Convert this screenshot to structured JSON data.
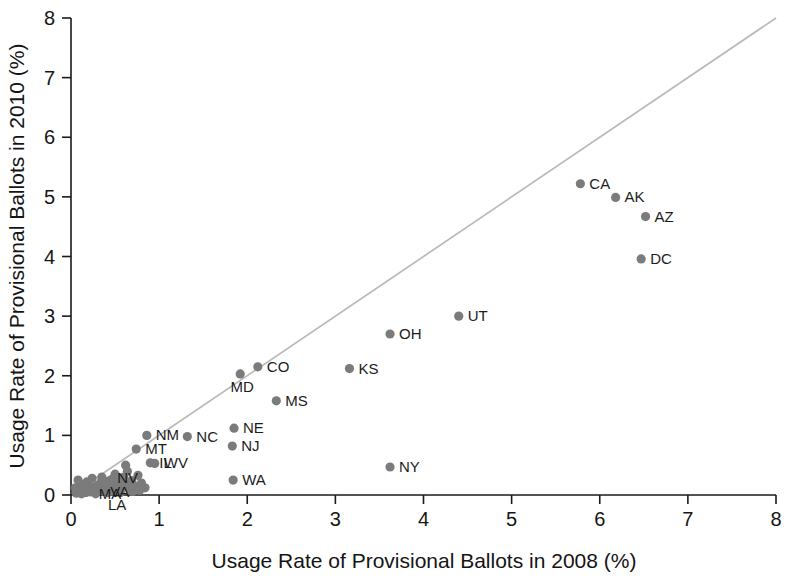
{
  "chart_data": {
    "type": "scatter",
    "title": "",
    "xlabel": "Usage Rate of Provisional Ballots in 2008 (%)",
    "ylabel": "Usage Rate of Provisional Ballots in 2010 (%)",
    "xlim": [
      0,
      8
    ],
    "ylim": [
      0,
      8
    ],
    "xticks": [
      "0",
      "1",
      "2",
      "3",
      "4",
      "5",
      "6",
      "7",
      "8"
    ],
    "yticks": [
      "0",
      "1",
      "2",
      "3",
      "4",
      "5",
      "6",
      "7",
      "8"
    ],
    "grid": false,
    "legend": "none",
    "marker_color": "#7b7b7b",
    "reference_line": {
      "label": "45-degree identity line",
      "color": "#b9b9b9",
      "from": [
        0,
        0
      ],
      "to": [
        8,
        8
      ]
    },
    "points": [
      {
        "label": "CA",
        "x": 5.78,
        "y": 5.22,
        "label_pos": "right"
      },
      {
        "label": "AK",
        "x": 6.18,
        "y": 4.99,
        "label_pos": "right"
      },
      {
        "label": "AZ",
        "x": 6.52,
        "y": 4.67,
        "label_pos": "right"
      },
      {
        "label": "DC",
        "x": 6.47,
        "y": 3.96,
        "label_pos": "right"
      },
      {
        "label": "UT",
        "x": 4.4,
        "y": 3.0,
        "label_pos": "right"
      },
      {
        "label": "OH",
        "x": 3.62,
        "y": 2.7,
        "label_pos": "right"
      },
      {
        "label": "KS",
        "x": 3.16,
        "y": 2.12,
        "label_pos": "right"
      },
      {
        "label": "CO",
        "x": 2.12,
        "y": 2.15,
        "label_pos": "right"
      },
      {
        "label": "MD",
        "x": 1.92,
        "y": 2.03,
        "label_pos": "below"
      },
      {
        "label": "MS",
        "x": 2.33,
        "y": 1.58,
        "label_pos": "right"
      },
      {
        "label": "NE",
        "x": 1.85,
        "y": 1.12,
        "label_pos": "right"
      },
      {
        "label": "NJ",
        "x": 1.83,
        "y": 0.82,
        "label_pos": "right"
      },
      {
        "label": "WA",
        "x": 1.84,
        "y": 0.25,
        "label_pos": "right"
      },
      {
        "label": "NY",
        "x": 3.62,
        "y": 0.47,
        "label_pos": "right"
      },
      {
        "label": "NC",
        "x": 1.32,
        "y": 0.98,
        "label_pos": "right"
      },
      {
        "label": "NM",
        "x": 0.86,
        "y": 1.0,
        "label_pos": "right"
      },
      {
        "label": "MT",
        "x": 0.74,
        "y": 0.77,
        "label_pos": "right"
      },
      {
        "label": "NV",
        "x": 0.62,
        "y": 0.5,
        "label_pos": "below"
      },
      {
        "label": "IL",
        "x": 0.9,
        "y": 0.54,
        "label_pos": "right"
      },
      {
        "label": "WV",
        "x": 0.95,
        "y": 0.53,
        "label_pos": "right"
      },
      {
        "label": "MA",
        "x": 0.42,
        "y": 0.23,
        "label_pos": "below"
      },
      {
        "label": "VA",
        "x": 0.53,
        "y": 0.27,
        "label_pos": "below"
      },
      {
        "label": "LA",
        "x": 0.5,
        "y": 0.05,
        "label_pos": "below"
      },
      {
        "label": "",
        "x": 0.06,
        "y": 0.03,
        "label_pos": "none"
      },
      {
        "label": "",
        "x": 0.09,
        "y": 0.05,
        "label_pos": "none"
      },
      {
        "label": "",
        "x": 0.12,
        "y": 0.02,
        "label_pos": "none"
      },
      {
        "label": "",
        "x": 0.15,
        "y": 0.07,
        "label_pos": "none"
      },
      {
        "label": "",
        "x": 0.17,
        "y": 0.04,
        "label_pos": "none"
      },
      {
        "label": "",
        "x": 0.2,
        "y": 0.1,
        "label_pos": "none"
      },
      {
        "label": "",
        "x": 0.22,
        "y": 0.05,
        "label_pos": "none"
      },
      {
        "label": "",
        "x": 0.25,
        "y": 0.13,
        "label_pos": "none"
      },
      {
        "label": "",
        "x": 0.27,
        "y": 0.07,
        "label_pos": "none"
      },
      {
        "label": "",
        "x": 0.3,
        "y": 0.16,
        "label_pos": "none"
      },
      {
        "label": "",
        "x": 0.32,
        "y": 0.09,
        "label_pos": "none"
      },
      {
        "label": "",
        "x": 0.34,
        "y": 0.21,
        "label_pos": "none"
      },
      {
        "label": "",
        "x": 0.36,
        "y": 0.12,
        "label_pos": "none"
      },
      {
        "label": "",
        "x": 0.38,
        "y": 0.06,
        "label_pos": "none"
      },
      {
        "label": "",
        "x": 0.4,
        "y": 0.17,
        "label_pos": "none"
      },
      {
        "label": "",
        "x": 0.44,
        "y": 0.11,
        "label_pos": "none"
      },
      {
        "label": "",
        "x": 0.46,
        "y": 0.26,
        "label_pos": "none"
      },
      {
        "label": "",
        "x": 0.48,
        "y": 0.15,
        "label_pos": "none"
      },
      {
        "label": "",
        "x": 0.52,
        "y": 0.09,
        "label_pos": "none"
      },
      {
        "label": "",
        "x": 0.55,
        "y": 0.2,
        "label_pos": "none"
      },
      {
        "label": "",
        "x": 0.58,
        "y": 0.14,
        "label_pos": "none"
      },
      {
        "label": "",
        "x": 0.6,
        "y": 0.3,
        "label_pos": "none"
      },
      {
        "label": "",
        "x": 0.63,
        "y": 0.18,
        "label_pos": "none"
      },
      {
        "label": "",
        "x": 0.66,
        "y": 0.1,
        "label_pos": "none"
      },
      {
        "label": "",
        "x": 0.69,
        "y": 0.24,
        "label_pos": "none"
      },
      {
        "label": "",
        "x": 0.72,
        "y": 0.15,
        "label_pos": "none"
      },
      {
        "label": "",
        "x": 0.76,
        "y": 0.33,
        "label_pos": "none"
      },
      {
        "label": "",
        "x": 0.8,
        "y": 0.2,
        "label_pos": "none"
      },
      {
        "label": "",
        "x": 0.84,
        "y": 0.12,
        "label_pos": "none"
      },
      {
        "label": "",
        "x": 0.12,
        "y": 0.18,
        "label_pos": "none"
      },
      {
        "label": "",
        "x": 0.18,
        "y": 0.22,
        "label_pos": "none"
      },
      {
        "label": "",
        "x": 0.24,
        "y": 0.28,
        "label_pos": "none"
      },
      {
        "label": "",
        "x": 0.28,
        "y": 0.02,
        "label_pos": "none"
      },
      {
        "label": "",
        "x": 0.35,
        "y": 0.3,
        "label_pos": "none"
      },
      {
        "label": "",
        "x": 0.42,
        "y": 0.04,
        "label_pos": "none"
      },
      {
        "label": "",
        "x": 0.5,
        "y": 0.35,
        "label_pos": "none"
      },
      {
        "label": "",
        "x": 0.56,
        "y": 0.04,
        "label_pos": "none"
      },
      {
        "label": "",
        "x": 0.64,
        "y": 0.4,
        "label_pos": "none"
      },
      {
        "label": "",
        "x": 0.7,
        "y": 0.06,
        "label_pos": "none"
      },
      {
        "label": "",
        "x": 0.78,
        "y": 0.08,
        "label_pos": "none"
      },
      {
        "label": "",
        "x": 0.05,
        "y": 0.12,
        "label_pos": "none"
      },
      {
        "label": "",
        "x": 0.08,
        "y": 0.25,
        "label_pos": "none"
      },
      {
        "label": "",
        "x": 0.14,
        "y": 0.11,
        "label_pos": "none"
      }
    ]
  }
}
